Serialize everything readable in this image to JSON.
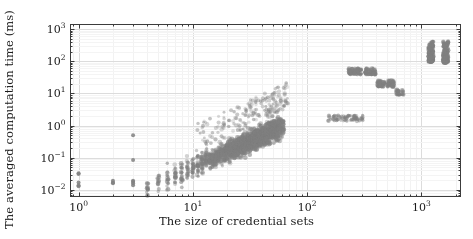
{
  "figure": {
    "background": "#ffffff",
    "frame_color": "#3c3c3c",
    "grid_color": "#e2e2e2",
    "point_color": "#808080"
  },
  "axes": {
    "x": {
      "label": "The size of credential sets",
      "scale": "log",
      "ticks": [
        "10⁰",
        "10¹",
        "10²",
        "10³"
      ],
      "tick_values": [
        1,
        10,
        100,
        1000
      ],
      "limits": [
        0.85,
        2200
      ]
    },
    "y": {
      "label": "The averaged computation time (ms)",
      "scale": "log",
      "ticks": [
        "10⁻²",
        "10⁻¹",
        "10⁰",
        "10¹",
        "10²",
        "10³"
      ],
      "tick_values": [
        0.01,
        0.1,
        1,
        10,
        100,
        1000
      ],
      "limits": [
        0.0062,
        1400
      ]
    }
  },
  "chart_data": {
    "type": "scatter",
    "title": "",
    "xlabel": "The size of credential sets",
    "ylabel": "The averaged computation time (ms)",
    "xscale": "log",
    "yscale": "log",
    "xlim": [
      0.85,
      2200
    ],
    "ylim": [
      0.0062,
      1400
    ],
    "grid": true,
    "legend": null,
    "marker": {
      "shape": "circle",
      "color": "#808080",
      "size": 2.2,
      "opacity": 0.55
    },
    "clusters": [
      {
        "name": "sparse-low-left",
        "x_range": [
          1,
          3
        ],
        "y_range": [
          0.012,
          0.5
        ],
        "n": 14
      },
      {
        "name": "dense-diagonal-band",
        "x_range": [
          4,
          60
        ],
        "y_range": [
          0.012,
          3.0
        ],
        "n": 1800
      },
      {
        "name": "upper-scatter-tail",
        "x_range": [
          12,
          70
        ],
        "y_range": [
          0.3,
          6.0
        ],
        "n": 180
      },
      {
        "name": "mid-plateau",
        "x_range": [
          150,
          300
        ],
        "y_range": [
          1.5,
          2.5
        ],
        "n": 60
      },
      {
        "name": "cluster-250",
        "x_range": [
          230,
          300
        ],
        "y_range": [
          38,
          60
        ],
        "n": 22
      },
      {
        "name": "cluster-340",
        "x_range": [
          320,
          400
        ],
        "y_range": [
          38,
          60
        ],
        "n": 18
      },
      {
        "name": "cluster-430",
        "x_range": [
          410,
          480
        ],
        "y_range": [
          16,
          26
        ],
        "n": 16
      },
      {
        "name": "cluster-520",
        "x_range": [
          500,
          580
        ],
        "y_range": [
          16,
          26
        ],
        "n": 14
      },
      {
        "name": "cluster-620",
        "x_range": [
          600,
          700
        ],
        "y_range": [
          9,
          13
        ],
        "n": 10
      },
      {
        "name": "tall-cluster-1200",
        "x_range": [
          1150,
          1280
        ],
        "y_range": [
          95,
          420
        ],
        "n": 45
      },
      {
        "name": "tall-cluster-1600",
        "x_range": [
          1550,
          1720
        ],
        "y_range": [
          90,
          430
        ],
        "n": 50
      }
    ],
    "points_note": "Point cloud generated deterministically from cluster envelopes above."
  }
}
